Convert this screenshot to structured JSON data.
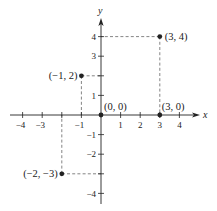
{
  "chart_data": {
    "type": "scatter",
    "title": "",
    "xlabel": "x",
    "ylabel": "y",
    "xlim": [
      -4.3,
      4.9
    ],
    "ylim": [
      -4.5,
      4.8
    ],
    "grid": false,
    "legend": null,
    "x_ticks": [
      -4,
      -3,
      -2,
      -1,
      1,
      2,
      3,
      4
    ],
    "x_tick_labels": [
      "−4",
      "−3",
      "",
      "−1",
      "1",
      "2",
      "3",
      "4"
    ],
    "y_ticks": [
      -4,
      -3,
      -2,
      -1,
      1,
      2,
      3,
      4
    ],
    "y_tick_labels": [
      "−4",
      "",
      "−2",
      "−1",
      "1",
      "",
      "3",
      "4"
    ],
    "points": [
      {
        "x": 3,
        "y": 4,
        "label": "(3, 4)",
        "guide_lines": true
      },
      {
        "x": -1,
        "y": 2,
        "label": "(−1, 2)",
        "guide_lines": true
      },
      {
        "x": 0,
        "y": 0,
        "label": "(0, 0)",
        "guide_lines": false
      },
      {
        "x": 3,
        "y": 0,
        "label": "(3, 0)",
        "guide_lines": false
      },
      {
        "x": -2,
        "y": -3,
        "label": "(−2, −3)",
        "guide_lines": true
      }
    ]
  },
  "colors": {
    "ink": "#222222",
    "dash": "#666666",
    "background": "#ffffff"
  }
}
